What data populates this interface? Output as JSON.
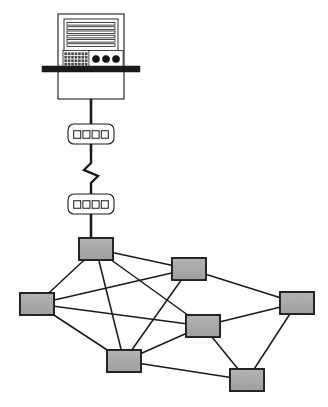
{
  "diagram": {
    "type": "network-topology",
    "width": 328,
    "height": 407,
    "background_color": "#ffffff"
  },
  "colors": {
    "background": "#ffffff",
    "line": "#1a1a1a",
    "node_fill": "#a8a8a8",
    "node_fill_light": "#bdbdbd",
    "node_stroke": "#1a1a1a",
    "device_fill": "#ffffff",
    "device_stroke": "#1a1a1a",
    "shelf_bar": "#1a1a1a",
    "knob_fill": "#141414",
    "keypad_fill": "#4a4a4a"
  },
  "server": {
    "label": "mainframe-server",
    "cabinet": {
      "x": 58,
      "y": 14,
      "width": 66,
      "height": 85
    },
    "panel": {
      "x": 64,
      "y": 19,
      "width": 54,
      "height": 45
    },
    "drive_slot_count": 6,
    "keypad": {
      "x": 64,
      "y": 52,
      "width": 24,
      "height": 14,
      "cols": 7,
      "rows": 4
    },
    "knob_count": 3,
    "knobs": [
      {
        "cx": 96,
        "cy": 59,
        "r": 3.6
      },
      {
        "cx": 106,
        "cy": 59,
        "r": 3.6
      },
      {
        "cx": 116,
        "cy": 59,
        "r": 3.6
      }
    ],
    "shelf": {
      "x": 42,
      "y": 66,
      "width": 98,
      "height": 6
    }
  },
  "hubs": [
    {
      "label": "hub-upper",
      "name": "hub-device-1",
      "x": 68,
      "y": 124,
      "width": 46,
      "height": 20,
      "port_count": 4
    },
    {
      "label": "hub-lower",
      "name": "hub-device-2",
      "x": 68,
      "y": 194,
      "width": 46,
      "height": 20,
      "port_count": 4
    }
  ],
  "cables": {
    "server_to_hub1": {
      "x": 91,
      "y1": 99,
      "y2": 124
    },
    "hub1_to_hub2": {
      "x": 91,
      "y1": 144,
      "y2": 194,
      "has_lightning": true
    },
    "hub2_to_mesh": {
      "x": 91,
      "y1": 214,
      "y2": 238
    }
  },
  "lightning": {
    "label": "lightning-bolt-link",
    "points": "91,152 91,163 84,170 98,176 91,183 91,196"
  },
  "mesh": {
    "label": "mesh-backbone",
    "node_width": 34,
    "node_height": 22,
    "nodes": [
      {
        "id": "n1",
        "name": "mesh-node-top",
        "cx": 96,
        "cy": 249
      },
      {
        "id": "n2",
        "name": "mesh-node-upper-right",
        "cx": 189,
        "cy": 269
      },
      {
        "id": "n3",
        "name": "mesh-node-left",
        "cx": 37,
        "cy": 304
      },
      {
        "id": "n4",
        "name": "mesh-node-right",
        "cx": 297,
        "cy": 303
      },
      {
        "id": "n5",
        "name": "mesh-node-center",
        "cx": 203,
        "cy": 326
      },
      {
        "id": "n6",
        "name": "mesh-node-bottom-left",
        "cx": 124,
        "cy": 361
      },
      {
        "id": "n7",
        "name": "mesh-node-bottom-right",
        "cx": 247,
        "cy": 380
      }
    ],
    "edges": [
      {
        "from": "n1",
        "to": "n2"
      },
      {
        "from": "n1",
        "to": "n3"
      },
      {
        "from": "n1",
        "to": "n5"
      },
      {
        "from": "n1",
        "to": "n6"
      },
      {
        "from": "n2",
        "to": "n3"
      },
      {
        "from": "n2",
        "to": "n4"
      },
      {
        "from": "n2",
        "to": "n6"
      },
      {
        "from": "n3",
        "to": "n5"
      },
      {
        "from": "n3",
        "to": "n6"
      },
      {
        "from": "n4",
        "to": "n5"
      },
      {
        "from": "n4",
        "to": "n7"
      },
      {
        "from": "n5",
        "to": "n6"
      },
      {
        "from": "n5",
        "to": "n7"
      },
      {
        "from": "n6",
        "to": "n7"
      }
    ],
    "edge_count": 14,
    "node_count": 7
  }
}
